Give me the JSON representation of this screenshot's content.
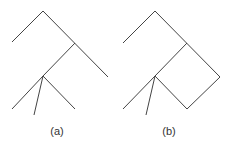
{
  "diagrams": [
    {
      "id": "a",
      "label": "(a)",
      "edges": [
        [
          43,
          11,
          12,
          42
        ],
        [
          43,
          11,
          108,
          77
        ],
        [
          75,
          43,
          43,
          76
        ],
        [
          43,
          76,
          12,
          109
        ],
        [
          43,
          76,
          34,
          115
        ],
        [
          43,
          76,
          75,
          109
        ]
      ]
    },
    {
      "id": "b",
      "label": "(b)",
      "edges": [
        [
          155,
          11,
          123,
          43
        ],
        [
          155,
          11,
          220,
          77
        ],
        [
          187,
          43,
          155,
          76
        ],
        [
          155,
          76,
          123,
          109
        ],
        [
          155,
          76,
          146,
          115
        ],
        [
          155,
          76,
          187,
          109
        ],
        [
          187,
          109,
          220,
          77
        ]
      ]
    }
  ],
  "style": {
    "stroke": "#444444"
  }
}
